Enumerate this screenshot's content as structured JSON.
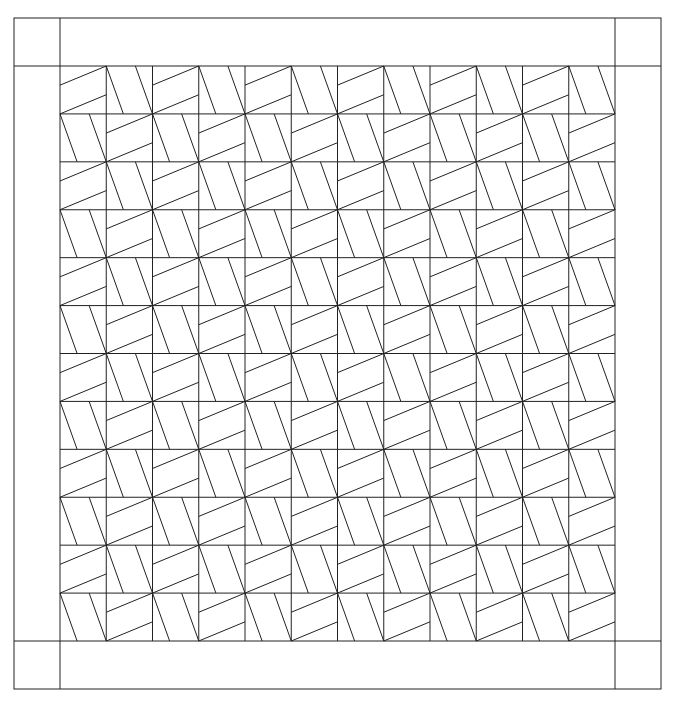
{
  "canvas": {
    "width": 676,
    "height": 701,
    "background": "#ffffff"
  },
  "stroke": {
    "color": "#222222",
    "width": 1
  },
  "border": {
    "outer": {
      "x1": 14,
      "y1": 18,
      "x2": 661,
      "y2": 689
    },
    "inner": {
      "x1": 60,
      "y1": 66,
      "x2": 615,
      "y2": 641
    },
    "corner_blocks": [
      "top-left",
      "top-right",
      "bottom-left",
      "bottom-right"
    ]
  },
  "grid": {
    "rows": 12,
    "cols": 12,
    "pattern": "checkerboard",
    "even_cell_type": "A",
    "odd_cell_type": "B"
  },
  "cell_types": {
    "A": {
      "description": "two parallel lines rising left-to-right",
      "lines": [
        {
          "x1": 0,
          "y1": 0.4,
          "x2": 1,
          "y2": 0
        },
        {
          "x1": 0,
          "y1": 1,
          "x2": 1,
          "y2": 0.6
        }
      ]
    },
    "B": {
      "description": "two parallel lines falling top-to-bottom",
      "lines": [
        {
          "x1": 0,
          "y1": 0,
          "x2": 0.37,
          "y2": 1
        },
        {
          "x1": 0.63,
          "y1": 0,
          "x2": 1,
          "y2": 1
        }
      ]
    }
  }
}
